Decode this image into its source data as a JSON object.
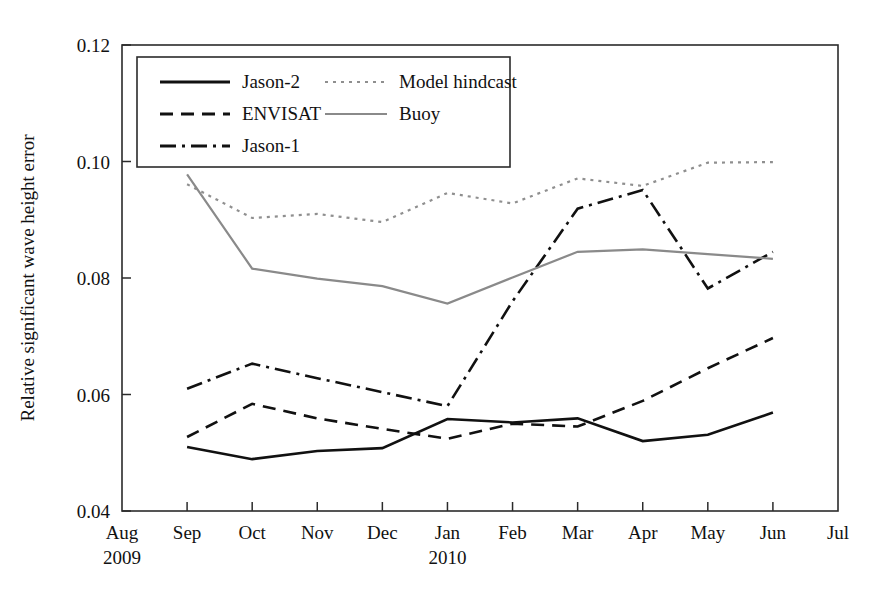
{
  "chart_data": {
    "type": "line",
    "title": "",
    "xlabel": "",
    "ylabel": "Relative significant wave height error",
    "ylim": [
      0.04,
      0.12
    ],
    "yticks": [
      0.04,
      0.06,
      0.08,
      0.1,
      0.12
    ],
    "ytick_labels": [
      "0.04",
      "0.06",
      "0.08",
      "0.10",
      "0.12"
    ],
    "grid": false,
    "legend_position": "top-left-inside",
    "x": [
      "Aug",
      "Sep",
      "Oct",
      "Nov",
      "Dec",
      "Jan",
      "Feb",
      "Mar",
      "Apr",
      "May",
      "Jun",
      "Jul"
    ],
    "xtick_labels": [
      "Aug",
      "Sep",
      "Oct",
      "Nov",
      "Dec",
      "Jan",
      "Feb",
      "Mar",
      "Apr",
      "May",
      "Jun",
      "Jul"
    ],
    "xtick_sublabels": {
      "Aug": "2009",
      "Jan": "2010"
    },
    "year_start": "2009",
    "year_second": "2010",
    "series": [
      {
        "name": "Jason-2",
        "style": "solid",
        "color": "#111111",
        "width": 2.6,
        "x": [
          "Sep",
          "Oct",
          "Nov",
          "Dec",
          "Jan",
          "Feb",
          "Mar",
          "Apr",
          "May",
          "Jun"
        ],
        "values": [
          0.051,
          0.0489,
          0.0503,
          0.0508,
          0.0558,
          0.0552,
          0.0559,
          0.052,
          0.0531,
          0.0569
        ]
      },
      {
        "name": "ENVISAT",
        "style": "dashed",
        "color": "#111111",
        "width": 2.6,
        "x": [
          "Sep",
          "Oct",
          "Nov",
          "Dec",
          "Jan",
          "Feb",
          "Mar",
          "Apr",
          "May",
          "Jun"
        ],
        "values": [
          0.0527,
          0.0584,
          0.0559,
          0.0541,
          0.0524,
          0.055,
          0.0545,
          0.0589,
          0.0645,
          0.0697
        ]
      },
      {
        "name": "Jason-1",
        "style": "dashdot",
        "color": "#111111",
        "width": 2.6,
        "x": [
          "Sep",
          "Oct",
          "Nov",
          "Dec",
          "Jan",
          "Feb",
          "Mar",
          "Apr",
          "May",
          "Jun"
        ],
        "values": [
          0.061,
          0.0653,
          0.0628,
          0.0604,
          0.058,
          0.076,
          0.0919,
          0.0951,
          0.0782,
          0.0845
        ]
      },
      {
        "name": "Model hindcast",
        "style": "dotted",
        "color": "#8f8f8f",
        "width": 2.2,
        "x": [
          "Sep",
          "Oct",
          "Nov",
          "Dec",
          "Jan",
          "Feb",
          "Mar",
          "Apr",
          "May",
          "Jun"
        ],
        "values": [
          0.0961,
          0.0903,
          0.091,
          0.0896,
          0.0946,
          0.0928,
          0.0971,
          0.0958,
          0.0998,
          0.0999
        ]
      },
      {
        "name": "Buoy",
        "style": "solid",
        "color": "#8a8a8a",
        "width": 2.2,
        "x": [
          "Sep",
          "Oct",
          "Nov",
          "Dec",
          "Jan",
          "Feb",
          "Mar",
          "Apr",
          "May",
          "Jun"
        ],
        "values": [
          0.0978,
          0.0816,
          0.0799,
          0.0786,
          0.0756,
          0.0801,
          0.0845,
          0.0849,
          0.0841,
          0.0833
        ]
      }
    ],
    "legend": [
      {
        "label": "Jason-2",
        "style": "solid",
        "color": "#111111"
      },
      {
        "label": "Model hindcast",
        "style": "dotted",
        "color": "#8f8f8f"
      },
      {
        "label": "ENVISAT",
        "style": "dashed",
        "color": "#111111"
      },
      {
        "label": "Buoy",
        "style": "solid",
        "color": "#8a8a8a"
      },
      {
        "label": "Jason-1",
        "style": "dashdot",
        "color": "#111111"
      }
    ]
  }
}
